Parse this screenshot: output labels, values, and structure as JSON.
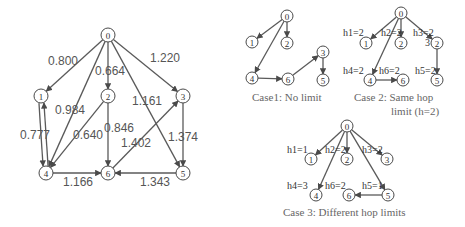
{
  "main_graph": {
    "nodes": [
      {
        "id": "0",
        "label": "0"
      },
      {
        "id": "1",
        "label": "1"
      },
      {
        "id": "2",
        "label": "2"
      },
      {
        "id": "3",
        "label": "3"
      },
      {
        "id": "4",
        "label": "4"
      },
      {
        "id": "5",
        "label": "5"
      },
      {
        "id": "6",
        "label": "6"
      }
    ],
    "edges": [
      {
        "from": "0",
        "to": "1",
        "weight": "0.800"
      },
      {
        "from": "0",
        "to": "2",
        "weight": "0.664"
      },
      {
        "from": "0",
        "to": "3",
        "weight": "1.220"
      },
      {
        "from": "0",
        "to": "4",
        "weight": "0.984"
      },
      {
        "from": "0",
        "to": "5",
        "weight": "1.161"
      },
      {
        "from": "1",
        "to": "4",
        "weight": "0.777"
      },
      {
        "from": "4",
        "to": "1",
        "weight": ""
      },
      {
        "from": "2",
        "to": "4",
        "weight": "0.640"
      },
      {
        "from": "2",
        "to": "6",
        "weight": "0.846"
      },
      {
        "from": "6",
        "to": "3",
        "weight": "1.402"
      },
      {
        "from": "3",
        "to": "5",
        "weight": "1.374"
      },
      {
        "from": "4",
        "to": "6",
        "weight": "1.166"
      },
      {
        "from": "5",
        "to": "6",
        "weight": "1.343"
      }
    ]
  },
  "case1": {
    "caption": "Case1: No limit",
    "nodes": [
      "0",
      "1",
      "2",
      "3",
      "4",
      "5",
      "6"
    ],
    "edges": [
      [
        "0",
        "1"
      ],
      [
        "0",
        "2"
      ],
      [
        "0",
        "4"
      ],
      [
        "4",
        "6"
      ],
      [
        "6",
        "3"
      ],
      [
        "3",
        "5"
      ]
    ]
  },
  "case2": {
    "caption_line1": "Case 2: Same hop",
    "caption_line2": "limit (h=2)",
    "nodes": [
      "0",
      "1",
      "2",
      "2",
      "4",
      "6",
      "5"
    ],
    "side_label": "3",
    "hop_labels": [
      "h1=2",
      "h2=2",
      "h3=2",
      "h4=2",
      "h6=2",
      "h5=2"
    ],
    "edges": [
      [
        "0",
        "1"
      ],
      [
        "0",
        "2"
      ],
      [
        "0",
        "3"
      ],
      [
        "0",
        "4"
      ],
      [
        "4",
        "6"
      ],
      [
        "3",
        "5"
      ]
    ]
  },
  "case3": {
    "caption": "Case 3: Different hop limits",
    "nodes": [
      "0",
      "1",
      "2",
      "3",
      "4",
      "6",
      "5"
    ],
    "hop_labels": [
      "h1=1",
      "h2=2",
      "h3=2",
      "h4=3",
      "h6=2",
      "h5=1"
    ],
    "edges": [
      [
        "0",
        "1"
      ],
      [
        "0",
        "2"
      ],
      [
        "0",
        "3"
      ],
      [
        "0",
        "4"
      ],
      [
        "0",
        "5"
      ],
      [
        "5",
        "6"
      ]
    ]
  }
}
